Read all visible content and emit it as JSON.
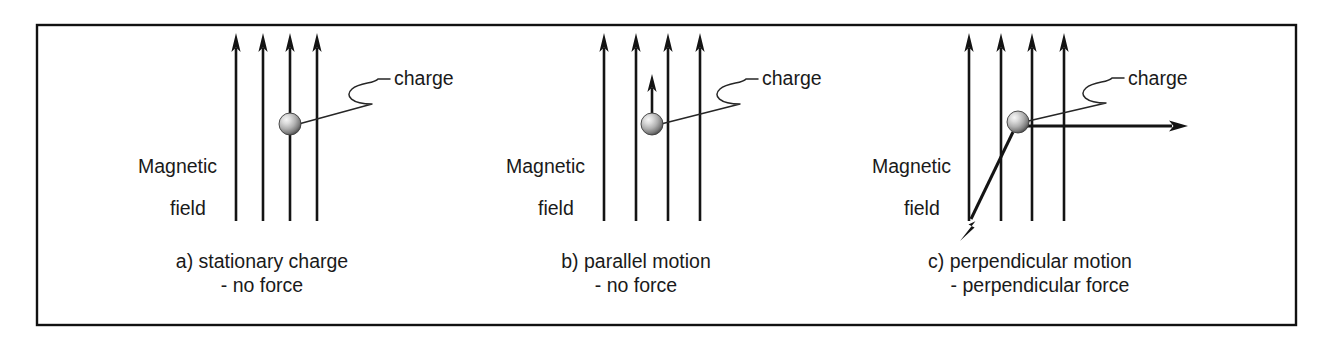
{
  "figure": {
    "background_color": "#ffffff",
    "border_color": "#111111",
    "ink_color": "#141414",
    "leader_color": "#262626",
    "sphere_colors": {
      "highlight": "#f2f2f2",
      "mid": "#b4b4b4",
      "shadow": "#5e5e5e",
      "edge": "#3c3c3c"
    }
  },
  "panels": [
    {
      "id": "panel-a",
      "field_label_line1": "Magnetic",
      "field_label_line2": "field",
      "charge_label": "charge",
      "caption_line1": "a) stationary charge",
      "caption_line2": "- no force",
      "field_line_count": 4,
      "field_line_x": [
        236,
        263,
        290,
        317
      ],
      "field_top_y": 36,
      "field_bottom_y": 221,
      "sphere_x": 290,
      "sphere_y": 124,
      "sphere_r": 11,
      "has_velocity_arrow": false,
      "has_force_arrow": false,
      "charge_text_x": 394,
      "charge_text_y": 85,
      "magnetic_text_x": 138,
      "magnetic_text_y": 173,
      "field_text_x": 170,
      "field_text_y": 215,
      "caption_center_x": 262,
      "caption_line1_y": 268,
      "caption_line2_y": 292
    },
    {
      "id": "panel-b",
      "field_label_line1": "Magnetic",
      "field_label_line2": "field",
      "charge_label": "charge",
      "caption_line1": "b)  parallel motion",
      "caption_line2": "- no force",
      "field_line_count": 4,
      "field_line_x": [
        604,
        636,
        668,
        700
      ],
      "field_top_y": 36,
      "field_bottom_y": 221,
      "sphere_x": 652,
      "sphere_y": 124,
      "sphere_r": 11,
      "has_velocity_arrow": true,
      "velocity_from_y": 114,
      "velocity_to_y": 76,
      "has_force_arrow": false,
      "charge_text_x": 762,
      "charge_text_y": 85,
      "magnetic_text_x": 506,
      "magnetic_text_y": 173,
      "field_text_x": 538,
      "field_text_y": 215,
      "caption_center_x": 636,
      "caption_line1_y": 268,
      "caption_line2_y": 292
    },
    {
      "id": "panel-c",
      "field_label_line1": "Magnetic",
      "field_label_line2": "field",
      "charge_label": "charge",
      "caption_line1": "c) perpendicular motion",
      "caption_line2": "- perpendicular force",
      "field_line_count": 4,
      "field_line_x": [
        969,
        1001,
        1032,
        1064
      ],
      "field_top_y": 36,
      "field_bottom_y": 221,
      "sphere_x": 1018,
      "sphere_y": 122,
      "sphere_r": 11,
      "has_velocity_arrow": false,
      "has_force_arrow": true,
      "force_right_from_x": 1028,
      "force_right_to_x": 1186,
      "force_right_y": 126,
      "force_diag_from_x": 1012,
      "force_diag_from_y": 133,
      "force_diag_to_x": 961,
      "force_diag_to_y": 238,
      "charge_text_x": 1128,
      "charge_text_y": 85,
      "magnetic_text_x": 872,
      "magnetic_text_y": 173,
      "field_text_x": 904,
      "field_text_y": 215,
      "caption_center_x": 1030,
      "caption_line1_y": 268,
      "caption_line2_y": 292
    }
  ],
  "border": {
    "x": 37,
    "y": 25,
    "width": 1259,
    "height": 300
  }
}
